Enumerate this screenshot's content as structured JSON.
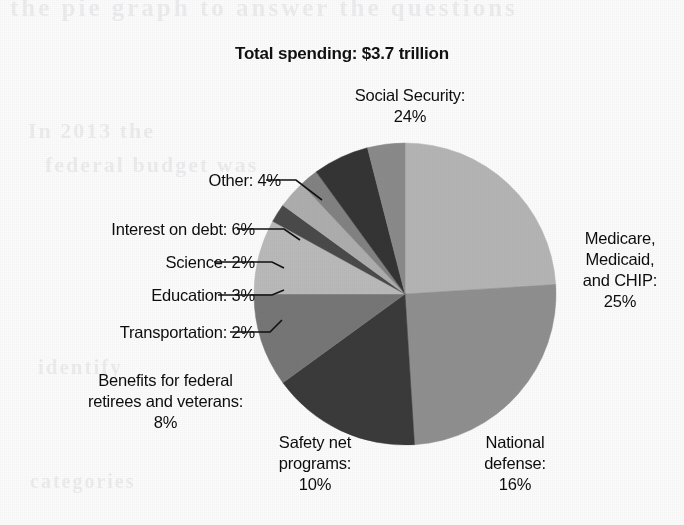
{
  "chart_data": {
    "type": "pie",
    "title": "Total spending: $3.7 trillion",
    "total_spending": "$3.7 trillion",
    "units": "percent of total federal spending",
    "legend": "none (direct labels with leader lines)",
    "start_angle_deg": 0,
    "direction": "clockwise",
    "categories": [
      "Social Security",
      "Medicare, Medicaid, and CHIP",
      "National defense",
      "Safety net programs",
      "Benefits for federal retirees and veterans",
      "Transportation",
      "Education",
      "Science",
      "Interest on debt",
      "Other"
    ],
    "values": [
      24,
      25,
      16,
      10,
      8,
      2,
      3,
      2,
      6,
      4
    ],
    "value_labels": [
      "24%",
      "25%",
      "16%",
      "10%",
      "8%",
      "2%",
      "3%",
      "2%",
      "6%",
      "4%"
    ],
    "colors": [
      "#b4b4b4",
      "#8f8f8f",
      "#3a3a3a",
      "#767676",
      "#b9b9b9",
      "#4a4a4a",
      "#adadad",
      "#828282",
      "#343434",
      "#8a8a8a"
    ],
    "slices": [
      {
        "name": "Social Security",
        "value": 24,
        "label": "Social Security:",
        "value_label": "24%",
        "color": "#b4b4b4",
        "start_deg": 0,
        "end_deg": 86.4
      },
      {
        "name": "Medicare, Medicaid, and CHIP",
        "value": 25,
        "label": "Medicare, Medicaid, and CHIP:",
        "value_label": "25%",
        "color": "#8f8f8f",
        "start_deg": 86.4,
        "end_deg": 176.4
      },
      {
        "name": "National defense",
        "value": 16,
        "label": "National defense:",
        "value_label": "16%",
        "color": "#3a3a3a",
        "start_deg": 176.4,
        "end_deg": 234.0
      },
      {
        "name": "Safety net programs",
        "value": 10,
        "label": "Safety net programs:",
        "value_label": "10%",
        "color": "#767676",
        "start_deg": 234.0,
        "end_deg": 270.0
      },
      {
        "name": "Benefits for federal retirees and veterans",
        "value": 8,
        "label": "Benefits for federal retirees and veterans:",
        "value_label": "8%",
        "color": "#b9b9b9",
        "start_deg": 270.0,
        "end_deg": 298.8
      },
      {
        "name": "Transportation",
        "value": 2,
        "label": "Transportation:",
        "value_label": "2%",
        "color": "#4a4a4a",
        "start_deg": 298.8,
        "end_deg": 306.0
      },
      {
        "name": "Education",
        "value": 3,
        "label": "Education:",
        "value_label": "3%",
        "color": "#adadad",
        "start_deg": 306.0,
        "end_deg": 316.8
      },
      {
        "name": "Science",
        "value": 2,
        "label": "Science:",
        "value_label": "2%",
        "color": "#828282",
        "start_deg": 316.8,
        "end_deg": 324.0
      },
      {
        "name": "Interest on debt",
        "value": 6,
        "label": "Interest on debt:",
        "value_label": "6%",
        "color": "#343434",
        "start_deg": 324.0,
        "end_deg": 345.6
      },
      {
        "name": "Other",
        "value": 4,
        "label": "Other:",
        "value_label": "4%",
        "color": "#8a8a8a",
        "start_deg": 345.6,
        "end_deg": 360.0
      }
    ]
  },
  "title": "Total spending: $3.7 trillion",
  "labels": {
    "social_security": "Social Security:\n24%",
    "medicare": "Medicare,\nMedicaid,\nand CHIP:\n25%",
    "national_defense": "National\ndefense:\n16%",
    "safety_net": "Safety net\nprograms:\n10%",
    "benefits": "Benefits for federal\nretirees and veterans:\n8%",
    "transportation": "Transportation: 2%",
    "education": "Education: 3%",
    "science": "Science: 2%",
    "interest": "Interest on debt: 6%",
    "other": "Other: 4%"
  },
  "ghost_text": {
    "top": "the pie graph to answer the questions",
    "mid": "In 2013 the",
    "mid2": "federal budget was",
    "low": "identify",
    "low2": "categories"
  }
}
